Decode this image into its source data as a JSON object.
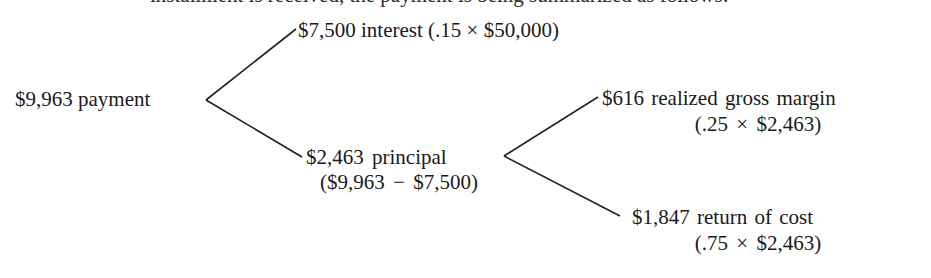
{
  "header": {
    "clipped_text": "installment is received, the payment is being summarized as follows:"
  },
  "tree": {
    "root": {
      "label": "$9,963 payment"
    },
    "interest": {
      "label": "$7,500 interest (.15 × $50,000)"
    },
    "principal": {
      "label": "$2,463 principal",
      "calc": "($9,963 − $7,500)"
    },
    "gross_margin": {
      "label": "$616 realized gross margin",
      "calc": "(.25 × $2,463)"
    },
    "return_of_cost": {
      "label": "$1,847 return of cost",
      "calc": "(.75 × $2,463)"
    }
  },
  "colors": {
    "text": "#1a1a1a",
    "lines": "#222222",
    "background": "#ffffff"
  }
}
